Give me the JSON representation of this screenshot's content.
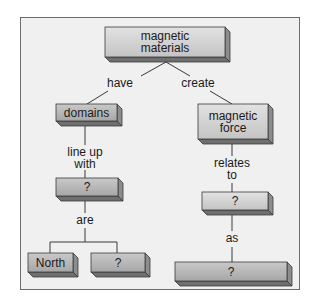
{
  "diagram": {
    "type": "concept-map",
    "colors": {
      "frame_bg": "#f0f0f0",
      "frame_border": "#6d6d6d",
      "box_face_light": "#dcdcdc",
      "box_face_dark": "#b3b3b3",
      "box_side": "#8c8c8c",
      "box_bottom": "#6f6f6f",
      "line": "#3a3a3a"
    },
    "nodes": {
      "root": {
        "label": "magnetic materials",
        "line1": "magnetic",
        "line2": "materials"
      },
      "domains": {
        "label": "domains"
      },
      "magnetic_force": {
        "label": "magnetic force",
        "line1": "magnetic",
        "line2": "force"
      },
      "left_unknown": {
        "label": "?"
      },
      "north": {
        "label": "North"
      },
      "pole_unknown": {
        "label": "?"
      },
      "right_unknown": {
        "label": "?"
      },
      "bottom_unknown": {
        "label": "?"
      }
    },
    "links": {
      "have": {
        "label": "have",
        "from": "magnetic materials",
        "to": "domains"
      },
      "create": {
        "label": "create",
        "from": "magnetic materials",
        "to": "magnetic force"
      },
      "line_up_with": {
        "label": "line up with",
        "line1": "line up",
        "line2": "with",
        "from": "domains",
        "to": "?"
      },
      "are": {
        "label": "are",
        "from": "?",
        "to": [
          "North",
          "?"
        ]
      },
      "relates_to": {
        "label": "relates to",
        "line1": "relates",
        "line2": "to",
        "from": "magnetic force",
        "to": "?"
      },
      "as": {
        "label": "as",
        "from": "?",
        "to": "?"
      }
    }
  }
}
